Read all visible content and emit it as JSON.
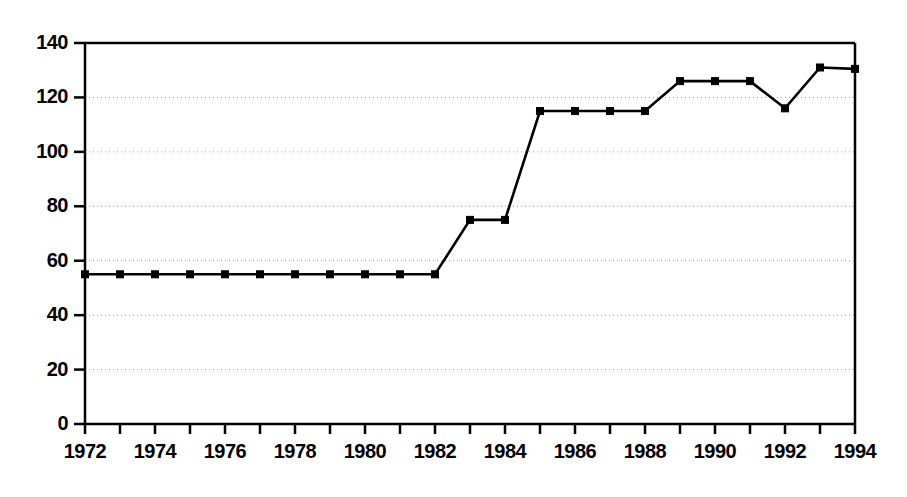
{
  "chart_data": {
    "type": "line",
    "title": "",
    "xlabel": "",
    "ylabel": "",
    "x": [
      1972,
      1973,
      1974,
      1975,
      1976,
      1977,
      1978,
      1979,
      1980,
      1981,
      1982,
      1983,
      1984,
      1985,
      1986,
      1987,
      1988,
      1989,
      1990,
      1991,
      1992,
      1993,
      1994
    ],
    "values": [
      55,
      55,
      55,
      55,
      55,
      55,
      55,
      55,
      55,
      55,
      55,
      75,
      75,
      115,
      115,
      115,
      115,
      126,
      126,
      126,
      116,
      131,
      130.5
    ],
    "series": [
      {
        "name": "series-1",
        "values": [
          55,
          55,
          55,
          55,
          55,
          55,
          55,
          55,
          55,
          55,
          55,
          75,
          75,
          115,
          115,
          115,
          115,
          126,
          126,
          126,
          116,
          131,
          130.5
        ]
      }
    ],
    "xlim": [
      1972,
      1994
    ],
    "ylim": [
      0,
      140
    ],
    "y_ticks": [
      0,
      20,
      40,
      60,
      80,
      100,
      120,
      140
    ],
    "y_tick_labels": [
      "0",
      "20",
      "40",
      "60",
      "80",
      "100",
      "120",
      "140"
    ],
    "x_ticks": [
      1972,
      1973,
      1974,
      1975,
      1976,
      1977,
      1978,
      1979,
      1980,
      1981,
      1982,
      1983,
      1984,
      1985,
      1986,
      1987,
      1988,
      1989,
      1990,
      1991,
      1992,
      1993,
      1994
    ],
    "x_tick_labels": [
      "1972",
      "",
      "1974",
      "",
      "1976",
      "",
      "1978",
      "",
      "1980",
      "",
      "1982",
      "",
      "1984",
      "",
      "1986",
      "",
      "1988",
      "",
      "1990",
      "",
      "1992",
      "",
      "1994"
    ],
    "grid": true,
    "grid_axis": "y",
    "grid_style": "dotted",
    "legend": false,
    "legend_position": "none",
    "marker": "square",
    "line_color": "#000000",
    "marker_color": "#000000",
    "grid_color": "#999999",
    "axis_color": "#000000",
    "background_color": "#ffffff"
  },
  "plot_geometry": {
    "left": 85,
    "right": 855,
    "top": 43,
    "bottom": 424
  }
}
